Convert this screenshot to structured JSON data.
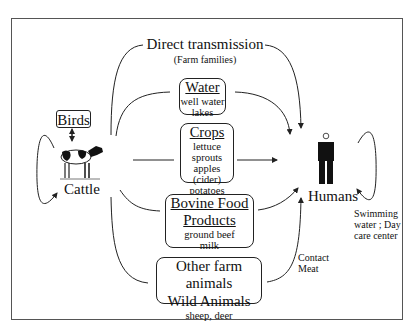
{
  "diagram": {
    "top": {
      "title": "Direct transmission",
      "subtitle": "(Farm families)"
    },
    "source": {
      "birds_label": "Birds",
      "cattle_label": "Cattle"
    },
    "target": {
      "humans_label": "Humans"
    },
    "routes": {
      "water": {
        "title": "Water",
        "items": [
          "well water",
          "lakes"
        ]
      },
      "crops": {
        "title": "Crops",
        "items": [
          "lettuce",
          "sprouts",
          "apples (cider)",
          "potatoes"
        ]
      },
      "bovine": {
        "title_line1": "Bovine Food",
        "title_line2": "Products",
        "items": [
          "ground beef",
          "milk"
        ]
      },
      "animals": {
        "line1": "Other farm animals",
        "line2": "Wild Animals",
        "items": [
          "sheep, deer"
        ]
      }
    },
    "annotations": {
      "contact": [
        "Contact",
        "Meat"
      ],
      "human_loop": [
        "Swimming",
        "water ; Day",
        "care center"
      ]
    },
    "colors": {
      "stroke": "#222222",
      "frame": "#555555",
      "background": "#ffffff"
    }
  }
}
